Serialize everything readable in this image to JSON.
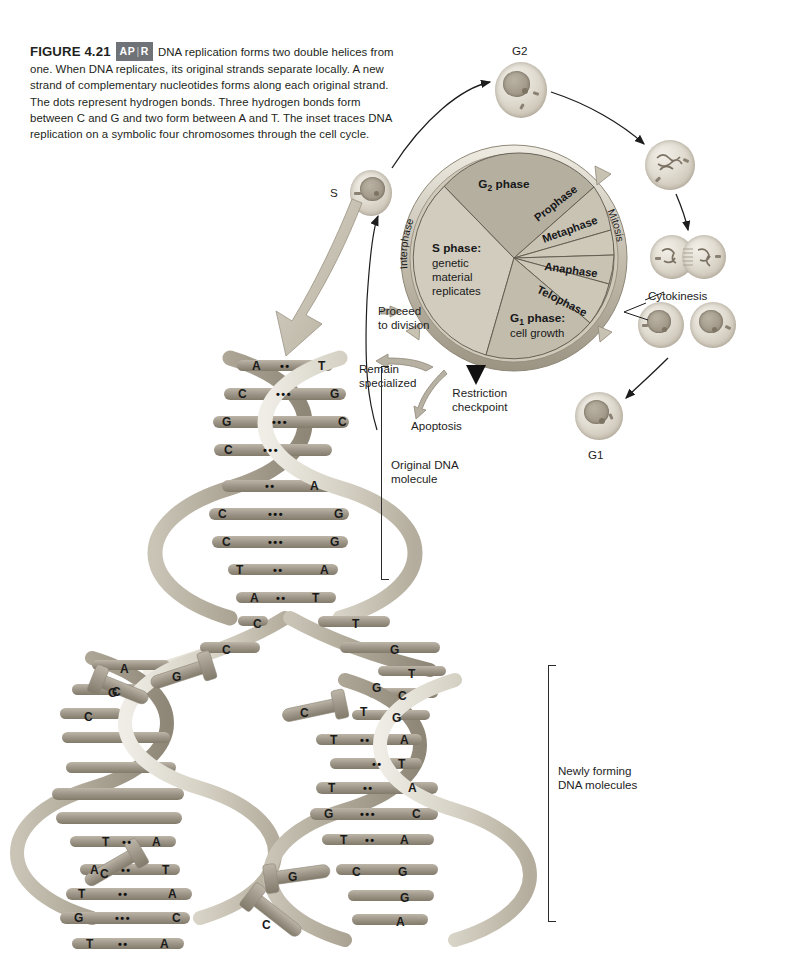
{
  "figure": {
    "number": "FIGURE 4.21",
    "badge_left": "AP",
    "badge_right": "R",
    "caption": "DNA replication forms two double helices from one. When DNA replicates, its original strands separate locally. A new strand of complementary nucleotides forms along each original strand. The dots represent hydrogen bonds. Three hydrogen bonds form between C and G and two form between A and T. The inset traces DNA replication on a symbolic four chromosomes through the cell cycle."
  },
  "cell_cycle": {
    "interphase_label": "Interphase",
    "mitosis_label": "Mitosis",
    "sectors": [
      {
        "name": "S phase",
        "label": "S phase:",
        "sublabel": "genetic\nmaterial\nreplicates"
      },
      {
        "name": "G2 phase",
        "label": "G",
        "sub": "2",
        "label_tail": " phase"
      },
      {
        "name": "Prophase",
        "label": "Prophase"
      },
      {
        "name": "Metaphase",
        "label": "Metaphase"
      },
      {
        "name": "Anaphase",
        "label": "Anaphase"
      },
      {
        "name": "Telophase",
        "label": "Telophase"
      },
      {
        "name": "G1 phase",
        "label": "G",
        "sub": "1",
        "label_tail": " phase:",
        "sublabel": "cell growth"
      }
    ],
    "annotations": {
      "proceed": "Proceed\nto division",
      "remain": "Remain\nspecialized",
      "apoptosis": "Apoptosis",
      "restriction": "Restriction\ncheckpoint",
      "cytokinesis": "Cytokinesis"
    },
    "cell_labels": {
      "s_phase": "S",
      "g2": "G2",
      "g1": "G1"
    }
  },
  "dna": {
    "original_label": "Original DNA\nmolecule",
    "newly_forming_label": "Newly forming\nDNA molecules",
    "original_pairs": [
      {
        "left": "A",
        "bonds": 2,
        "right": "T"
      },
      {
        "left": "C",
        "bonds": 3,
        "right": "G"
      },
      {
        "left": "G",
        "bonds": 3,
        "right": "C"
      },
      {
        "left": "C",
        "bonds": 3,
        "right": ""
      },
      {
        "left": "",
        "bonds": 2,
        "right": "A"
      },
      {
        "left": "C",
        "bonds": 3,
        "right": "G"
      },
      {
        "left": "C",
        "bonds": 3,
        "right": "G"
      },
      {
        "left": "T",
        "bonds": 2,
        "right": "A"
      },
      {
        "left": "A",
        "bonds": 2,
        "right": "T"
      }
    ],
    "fork_bases": {
      "left_strand": [
        "C",
        "A",
        "G",
        "C",
        "T",
        "A",
        "T",
        "G",
        "T",
        "C",
        "C",
        "T"
      ],
      "right_strand": [
        "G",
        "T",
        "C",
        "G",
        "G",
        "T",
        "T",
        "T",
        "G",
        "T",
        "C",
        "G",
        "G",
        "A"
      ]
    },
    "left_daughter_pairs": [
      {
        "left": "T",
        "bonds": 2,
        "right": "A"
      },
      {
        "left": "A",
        "bonds": 2,
        "right": "T"
      },
      {
        "left": "T",
        "bonds": 2,
        "right": "A"
      },
      {
        "left": "G",
        "bonds": 3,
        "right": "C"
      },
      {
        "left": "T",
        "bonds": 2,
        "right": "A"
      },
      {
        "left": "C",
        "bonds": 3,
        "right": "G"
      },
      {
        "left": "C",
        "bonds": 3,
        "right": "G"
      },
      {
        "left": "T",
        "bonds": 2,
        "right": "A"
      }
    ],
    "right_daughter_pairs": [
      {
        "left": "T",
        "bonds": 2,
        "right": "A"
      },
      {
        "left": "",
        "bonds": 2,
        "right": "T"
      },
      {
        "left": "T",
        "bonds": 2,
        "right": "A"
      },
      {
        "left": "G",
        "bonds": 3,
        "right": "C"
      },
      {
        "left": "T",
        "bonds": 2,
        "right": "A"
      },
      {
        "left": "C",
        "bonds": 3,
        "right": "G"
      }
    ],
    "free_nucleotides": [
      "C",
      "G",
      "C",
      "C",
      "G",
      "C"
    ]
  },
  "colors": {
    "interphase_ring": "#b8b2a4",
    "s_phase_fill": "#cfcabc",
    "g2_fill": "#b9b3a4",
    "mitosis_fill": "#cdc7b8",
    "g1_fill": "#c6c0b1",
    "dna_backbone": "#d8d4c8",
    "base_rung": "#9d968a",
    "text": "#1d1d1d"
  }
}
